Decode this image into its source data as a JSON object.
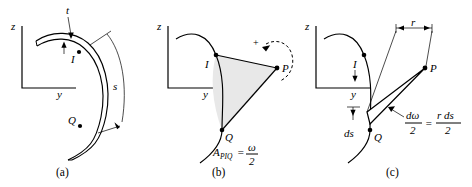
{
  "figure": {
    "background_color": "#ffffff",
    "ink_color": "#000000",
    "shade_color": "#e8e8e8",
    "panels": [
      {
        "id": "a",
        "caption": "(a)",
        "axes": {
          "vertical_label": "z",
          "horizontal_label": "y"
        },
        "labels": {
          "thickness": "t",
          "point_i": "I",
          "point_q": "Q",
          "arc_length": "s"
        }
      },
      {
        "id": "b",
        "caption": "(b)",
        "axes": {
          "vertical_label": "z",
          "horizontal_label": "y"
        },
        "labels": {
          "point_i": "I",
          "point_q": "Q",
          "point_p": "P",
          "sign": "+"
        },
        "equation": {
          "lhs_symbol": "A",
          "lhs_subscript": "PIQ",
          "equals": "=",
          "rhs_numerator": "ω",
          "rhs_denominator": "2"
        }
      },
      {
        "id": "c",
        "caption": "(c)",
        "axes": {
          "vertical_label": "z",
          "horizontal_label": "y"
        },
        "labels": {
          "point_i": "I",
          "point_q": "Q",
          "point_p": "P",
          "radius": "r",
          "arc_element": "ds"
        },
        "equation": {
          "lhs_numerator": "dω",
          "lhs_denominator": "2",
          "equals": "=",
          "rhs_numerator": "r ds",
          "rhs_denominator": "2"
        }
      }
    ]
  }
}
